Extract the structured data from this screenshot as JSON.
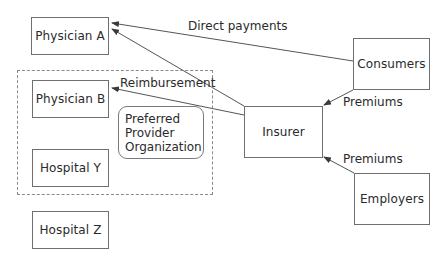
{
  "diagram": {
    "nodes": {
      "physician_a": "Physician A",
      "physician_b": "Physician B",
      "hospital_y": "Hospital Y",
      "hospital_z": "Hospital Z",
      "insurer": "Insurer",
      "consumers": "Consumers",
      "employers": "Employers"
    },
    "group": {
      "name": "Preferred Provider Organization",
      "lines": [
        "Preferred",
        "Provider",
        "Organization"
      ],
      "members": [
        "Physician B",
        "Hospital Y"
      ]
    },
    "edges": [
      {
        "from": "Consumers",
        "to": "Physician A",
        "label": "Direct payments"
      },
      {
        "from": "Insurer",
        "to": "Physician A",
        "label": ""
      },
      {
        "from": "Insurer",
        "to": "Physician B",
        "label": "Reimbursement"
      },
      {
        "from": "Consumers",
        "to": "Insurer",
        "label": "Premiums"
      },
      {
        "from": "Employers",
        "to": "Insurer",
        "label": "Premiums"
      }
    ],
    "labels": {
      "direct_payments": "Direct payments",
      "reimbursement": "Reimbursement",
      "premiums_consumers": "Premiums",
      "premiums_employers": "Premiums"
    }
  }
}
